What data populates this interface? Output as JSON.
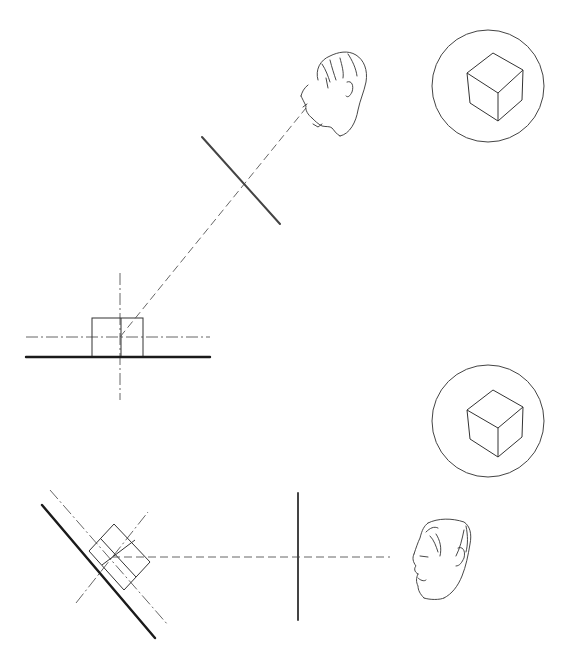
{
  "figure": {
    "colors": {
      "ink": "#1a1a1a",
      "construction": "#555555",
      "background": "#ffffff"
    }
  },
  "panels": [
    {
      "id": "top",
      "elements": {
        "ground_line": "thick horizontal base line",
        "object": "cube shown as square in elevation",
        "center_axes": "dash-dot horizontal and vertical axes through the cube",
        "sight_line": "dashed line of sight from eye to cube at an oblique angle",
        "picture_plane": "thick line perpendicular to the sight line",
        "observer": "sketched head looking down-left",
        "view": "cube seen corner-on inside circle"
      }
    },
    {
      "id": "bottom",
      "elements": {
        "ground_line": "thick diagonal base line",
        "object": "cube rotated 45 degrees",
        "center_axes": "dash-dot diagonal axes through the cube",
        "sight_line": "dashed horizontal line of sight",
        "picture_plane": "thick vertical line",
        "observer": "sketched head in profile looking left",
        "view": "cube seen corner-on inside circle"
      }
    }
  ]
}
